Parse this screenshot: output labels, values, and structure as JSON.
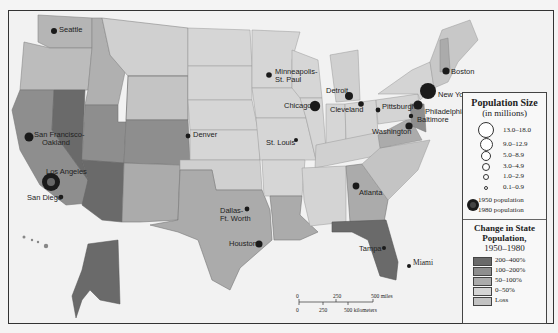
{
  "map": {
    "title": "US Population Change 1950-1980",
    "colors": {
      "c200_400": "#6a6a6a",
      "c100_200": "#8e8e8e",
      "c50_100": "#ababab",
      "c0_50": "#d4d4d4",
      "loss": "#c2c2c2",
      "water": "#f2f2f2",
      "city": "#1a1a1a"
    },
    "cities": [
      {
        "name": "Seattle",
        "label": "Seattle"
      },
      {
        "name": "San Francisco-Oakland",
        "label": "San Francisco-",
        "label2": "Oakland"
      },
      {
        "name": "Los Angeles",
        "label": "Los Angeles"
      },
      {
        "name": "San Diego",
        "label": "San Diego"
      },
      {
        "name": "Denver",
        "label": "Denver"
      },
      {
        "name": "Minneapolis-St. Paul",
        "label": "Minneapolis-",
        "label2": "St. Paul"
      },
      {
        "name": "Chicago",
        "label": "Chicago"
      },
      {
        "name": "Detroit",
        "label": "Detroit"
      },
      {
        "name": "Cleveland",
        "label": "Cleveland"
      },
      {
        "name": "Pittsburgh",
        "label": "Pittsburgh"
      },
      {
        "name": "St. Louis",
        "label": "St. Louis"
      },
      {
        "name": "Dallas-Ft. Worth",
        "label": "Dallas-",
        "label2": "Ft. Worth"
      },
      {
        "name": "Houston",
        "label": "Houston"
      },
      {
        "name": "Atlanta",
        "label": "Atlanta"
      },
      {
        "name": "Tampa",
        "label": "Tampa"
      },
      {
        "name": "Miami",
        "label": "Miami"
      },
      {
        "name": "Washington",
        "label": "Washington"
      },
      {
        "name": "Baltimore",
        "label": "Baltimore"
      },
      {
        "name": "Philadelphia",
        "label": "Philadelphia"
      },
      {
        "name": "New York",
        "label": "New York"
      },
      {
        "name": "Boston",
        "label": "Boston"
      }
    ]
  },
  "legend": {
    "population_title_1": "Population Size",
    "population_title_2": "(in millions)",
    "sizes": [
      "13.0–18.0",
      "9.0–12.9",
      "5.0–8.9",
      "3.0–4.9",
      "1.0–2.9",
      "0.1–0.9"
    ],
    "pop_1950": "1950 population",
    "pop_1980": "1980 population",
    "change_title_1": "Change in State",
    "change_title_2": "Population,",
    "change_title_3": "1950–1980",
    "change_classes": [
      "200–400%",
      "100–200%",
      "50–100%",
      "0–50%",
      "Loss"
    ]
  },
  "scale": {
    "miles": [
      "0",
      "250",
      "500 miles"
    ],
    "km": [
      "0",
      "250",
      "500 kilometers"
    ]
  }
}
